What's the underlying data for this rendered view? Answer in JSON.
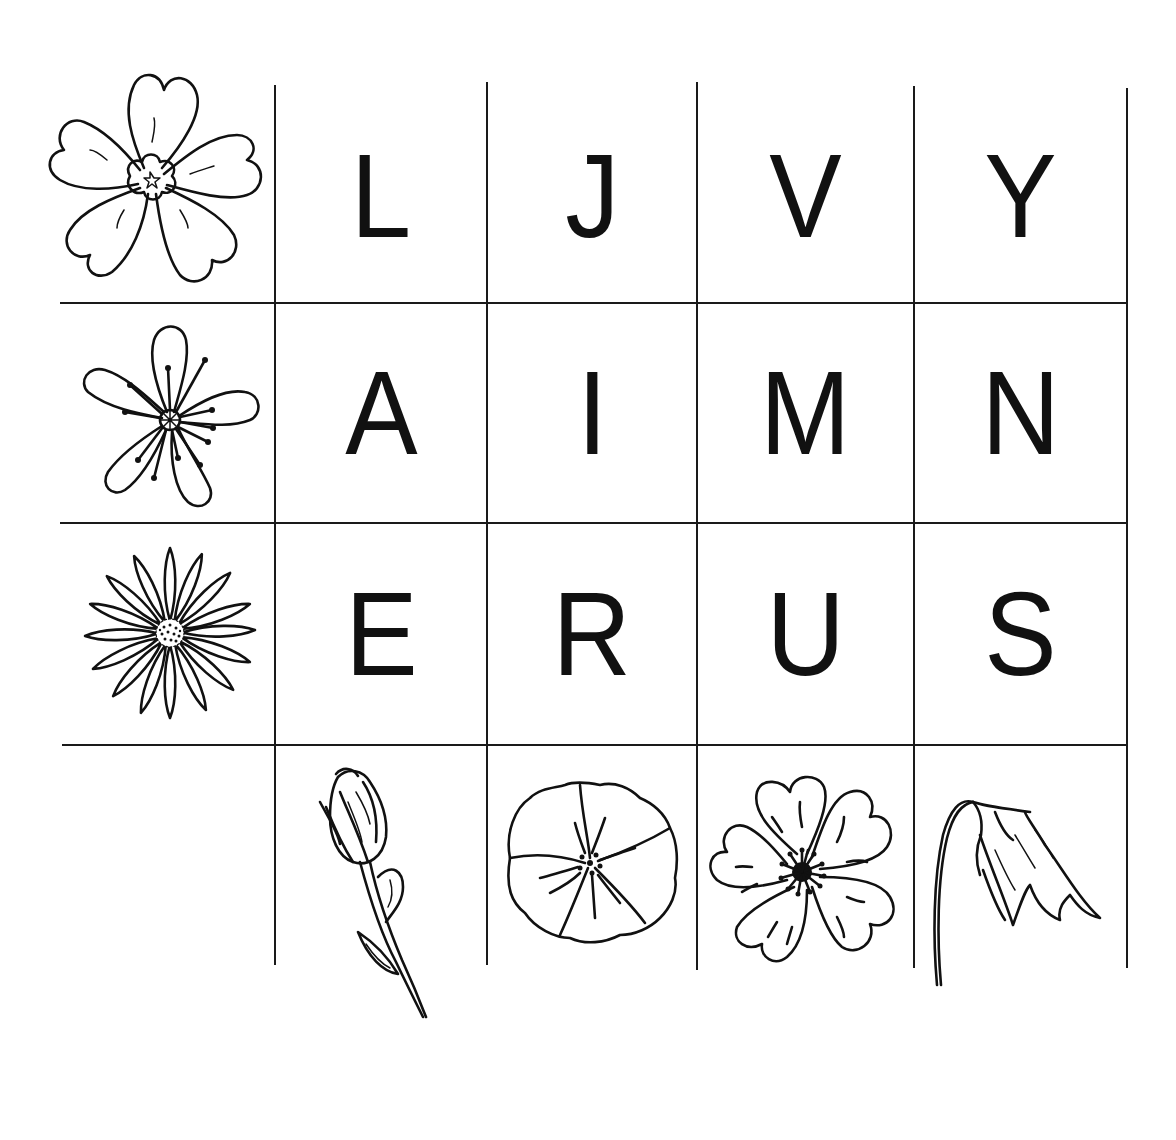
{
  "worksheet": {
    "grid": {
      "rows": [
        {
          "flower": "primrose-flower",
          "letters": [
            "L",
            "J",
            "V",
            "Y"
          ]
        },
        {
          "flower": "five-petal-flower",
          "letters": [
            "A",
            "I",
            "M",
            "N"
          ]
        },
        {
          "flower": "daisy-flower",
          "letters": [
            "E",
            "R",
            "U",
            "S"
          ]
        }
      ],
      "bottom_row_flowers": [
        "rose-bud",
        "morning-glory",
        "wild-rose",
        "bellflower"
      ]
    },
    "colors": {
      "background": "#ffffff",
      "ink": "#111111"
    }
  }
}
